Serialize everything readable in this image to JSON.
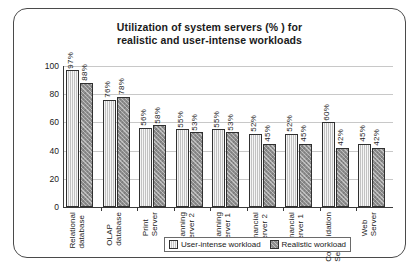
{
  "chart_data": {
    "type": "bar",
    "title_line1": "Utilization of system servers (% ) for",
    "title_line2": "realistic and user-intense workloads",
    "xlabel": "",
    "ylabel": "",
    "ylim": [
      0,
      100
    ],
    "ytick_labels": [
      "100",
      "80",
      "60",
      "40",
      "20",
      "0"
    ],
    "ytick_values": [
      100,
      80,
      60,
      40,
      20,
      0
    ],
    "grid": true,
    "legend_position": "bottom-center-inside",
    "categories": [
      "Relational database",
      "OLAP database",
      "Print Server",
      "Planning Server 2",
      "Planning Server 1",
      "Financial Server 2",
      "Financial Server 1",
      "Consolidation Server",
      "Web Server"
    ],
    "category_lines": [
      "Relational\ndatabase",
      "OLAP\ndatabase",
      "Print Server",
      "Planning\nServer 2",
      "Planning\nServer 1",
      "Financial\nServer 2",
      "Financial\nServer 1",
      "Consolidation\nServer",
      "Web Server"
    ],
    "series": [
      {
        "name": "User-intense workload",
        "color": "#c2c2c2",
        "values": [
          97,
          76,
          56,
          55,
          55,
          52,
          52,
          60,
          45
        ],
        "labels": [
          "97%",
          "76%",
          "56%",
          "55%",
          "55%",
          "52%",
          "52%",
          "60%",
          "45%"
        ]
      },
      {
        "name": "Realistic workload",
        "color": "#8e8e8e",
        "values": [
          88,
          78,
          58,
          53,
          53,
          45,
          45,
          42,
          42
        ],
        "labels": [
          "88%",
          "78%",
          "58%",
          "53%",
          "53%",
          "45%",
          "45%",
          "42%",
          "42%"
        ]
      }
    ]
  },
  "legend": {
    "entries": [
      {
        "label": "User-intense workload"
      },
      {
        "label": "Realistic workload"
      }
    ]
  }
}
